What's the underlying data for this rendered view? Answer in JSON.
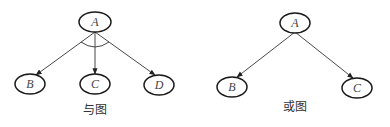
{
  "diagrams": [
    {
      "id": "and-graph",
      "caption": "与图",
      "nodes": [
        {
          "id": "A",
          "label": "A"
        },
        {
          "id": "B",
          "label": "B"
        },
        {
          "id": "C",
          "label": "C"
        },
        {
          "id": "D",
          "label": "D"
        }
      ],
      "edges": [
        {
          "from": "A",
          "to": "B"
        },
        {
          "from": "A",
          "to": "C"
        },
        {
          "from": "A",
          "to": "D"
        }
      ],
      "and_arc": true
    },
    {
      "id": "or-graph",
      "caption": "或图",
      "nodes": [
        {
          "id": "A",
          "label": "A"
        },
        {
          "id": "B",
          "label": "B"
        },
        {
          "id": "C",
          "label": "C"
        }
      ],
      "edges": [
        {
          "from": "A",
          "to": "B"
        },
        {
          "from": "A",
          "to": "C"
        }
      ],
      "and_arc": false
    }
  ]
}
